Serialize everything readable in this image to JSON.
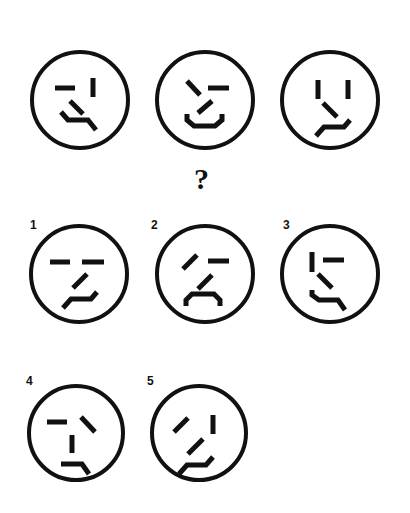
{
  "puzzle": {
    "question_mark": "?",
    "sequence": [
      {
        "id": "seq-1",
        "description": "face with horizontal left eye, vertical right eye, nose slash down-right, wavy mouth"
      },
      {
        "id": "seq-2",
        "description": "face with backslash left eye, horizontal right eye, nose slash up-right, smiling mouth"
      },
      {
        "id": "seq-3",
        "description": "face with two vertical eyes, nose slash down-right, wavy mouth rising right"
      }
    ],
    "options": [
      {
        "label": "1",
        "description": "two horizontal eyes, nose slash up-right, wavy mouth rising right"
      },
      {
        "label": "2",
        "description": "forward-slash left eye, horizontal right eye, nose slash up-right, frowning mouth"
      },
      {
        "label": "3",
        "description": "vertical left eye, horizontal right eye, nose slash down-right, wavy mouth"
      },
      {
        "label": "4",
        "description": "horizontal left eye, backslash right eye, vertical nose, mouth bent down right"
      },
      {
        "label": "5",
        "description": "forward-slash left eye, vertical right eye, nose slash up-right, wavy mouth rising right"
      }
    ]
  },
  "colors": {
    "stroke": "#111111",
    "background": "#ffffff"
  }
}
